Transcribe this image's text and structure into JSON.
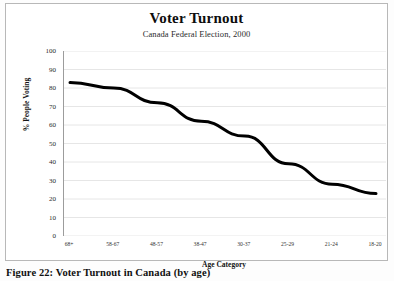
{
  "figure": {
    "caption": "Figure 22: Voter Turnout in Canada (by age)",
    "frame_color": "#b8b8b8"
  },
  "chart_data": {
    "type": "line",
    "title": "Voter Turnout",
    "subtitle": "Canada Federal Election, 2000",
    "xlabel": "Age Category",
    "ylabel": "% People Voting",
    "categories": [
      "68+",
      "58-67",
      "48-57",
      "38-47",
      "30-37",
      "25-29",
      "21-24",
      "18-20"
    ],
    "values": [
      83,
      80,
      72,
      62,
      54,
      39,
      28,
      23
    ],
    "ylim": [
      0,
      100
    ],
    "ytick_step": 10,
    "yticks": [
      100,
      90,
      80,
      70,
      60,
      50,
      40,
      30,
      20,
      10,
      0
    ],
    "grid": true,
    "grid_color": "#e6e6e6",
    "legend": false,
    "series": [
      {
        "name": "Voter turnout",
        "values": [
          83,
          80,
          72,
          62,
          54,
          39,
          28,
          23
        ],
        "color": "#000000",
        "line_width": 3,
        "markers": false
      }
    ]
  }
}
